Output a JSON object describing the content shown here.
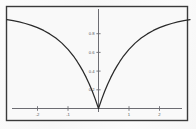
{
  "figure": {
    "frame_color": "#3a3a3a",
    "background_color": "#f8f8f8",
    "axis_color": "#6d6d73",
    "curve_color": "#2a2a2a"
  },
  "chart_data": {
    "type": "line",
    "title": "",
    "subtitle": "",
    "xlabel": "",
    "ylabel": "",
    "grid": false,
    "legend": null,
    "xlim": [
      -3,
      3
    ],
    "ylim": [
      0,
      1.08
    ],
    "xticks": [
      -2,
      -1,
      1,
      2
    ],
    "xtick_labels": [
      "-2",
      "-1",
      "1",
      "2"
    ],
    "yticks": [
      0.2,
      0.4,
      0.6,
      0.8
    ],
    "ytick_labels": [
      "0.2",
      "0.4",
      "0.6",
      "0.8"
    ],
    "annotations": [],
    "series": [
      {
        "name": "f(x)",
        "description": "symmetric cusped well, minimum 0 at x=0, asymptote near 1",
        "x": [
          -3.0,
          -2.8,
          -2.6,
          -2.4,
          -2.2,
          -2.0,
          -1.8,
          -1.6,
          -1.4,
          -1.2,
          -1.0,
          -0.9,
          -0.8,
          -0.7,
          -0.6,
          -0.5,
          -0.4,
          -0.3,
          -0.2,
          -0.1,
          0.0,
          0.1,
          0.2,
          0.3,
          0.4,
          0.5,
          0.6,
          0.7,
          0.8,
          0.9,
          1.0,
          1.2,
          1.4,
          1.6,
          1.8,
          2.0,
          2.2,
          2.4,
          2.6,
          2.8,
          3.0
        ],
        "y": [
          0.95,
          0.939,
          0.926,
          0.909,
          0.889,
          0.865,
          0.835,
          0.798,
          0.753,
          0.699,
          0.632,
          0.593,
          0.551,
          0.503,
          0.451,
          0.394,
          0.33,
          0.259,
          0.181,
          0.095,
          0.0,
          0.095,
          0.181,
          0.259,
          0.33,
          0.394,
          0.451,
          0.503,
          0.551,
          0.593,
          0.632,
          0.699,
          0.753,
          0.798,
          0.835,
          0.865,
          0.889,
          0.909,
          0.926,
          0.939,
          0.95
        ]
      }
    ]
  }
}
